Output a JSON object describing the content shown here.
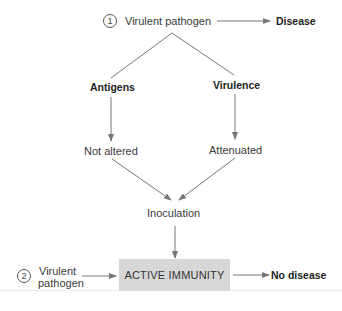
{
  "diagram": {
    "type": "flowchart",
    "top": {
      "step_number": "1",
      "source": "Virulent pathogen",
      "outcome": "Disease"
    },
    "branches": {
      "left": {
        "label": "Antigens",
        "result": "Not altered"
      },
      "right": {
        "label": "Virulence",
        "result": "Attenuated"
      }
    },
    "merge": "Inoculation",
    "bottom": {
      "step_number": "2",
      "source_line1": "Virulent",
      "source_line2": "pathogen",
      "state": "ACTIVE IMMUNITY",
      "outcome": "No disease"
    },
    "colors": {
      "arrow": "#777777",
      "box_fill": "#d7d7d7",
      "text": "#3a3a3a"
    }
  }
}
